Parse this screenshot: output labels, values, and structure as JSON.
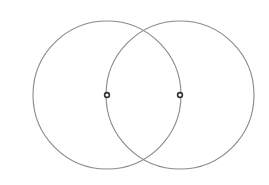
{
  "diagram": {
    "type": "vesica-piscis",
    "background": "#ffffff",
    "stroke_color": "#8a8a8a",
    "marker_color": "#333333",
    "circles": [
      {
        "cx": 107,
        "cy": 95,
        "r": 74
      },
      {
        "cx": 180,
        "cy": 95,
        "r": 74
      }
    ],
    "center_points": [
      {
        "cx": 107,
        "cy": 95
      },
      {
        "cx": 180,
        "cy": 95
      }
    ]
  }
}
